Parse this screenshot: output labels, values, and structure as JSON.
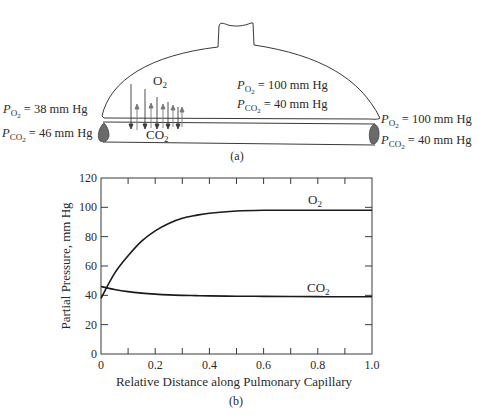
{
  "diagram_a": {
    "caption": "(a)",
    "alveolus_gas_label": "O",
    "alveolus_gas_sub": "2",
    "capillary_gas_label": "CO",
    "capillary_gas_sub": "2",
    "alveolus": {
      "po2": {
        "sym": "P",
        "sub": "O",
        "subsub": "2",
        "value": " = 100 mm Hg"
      },
      "pco2": {
        "sym": "P",
        "sub": "CO",
        "subsub": "2",
        "value": " = 40 mm Hg"
      }
    },
    "venous_end": {
      "po2": {
        "sym": "P",
        "sub": "O",
        "subsub": "2",
        "value": " = 38 mm Hg"
      },
      "pco2": {
        "sym": "P",
        "sub": "CO",
        "subsub": "2",
        "value": " = 46 mm Hg"
      }
    },
    "arterial_end": {
      "po2": {
        "sym": "P",
        "sub": "O",
        "subsub": "2",
        "value": " = 100 mm Hg"
      },
      "pco2": {
        "sym": "P",
        "sub": "CO",
        "subsub": "2",
        "value": " = 40 mm Hg"
      }
    }
  },
  "chart_data": {
    "type": "line",
    "title": "",
    "caption": "(b)",
    "xlabel": "Relative Distance along Pulmonary Capillary",
    "ylabel": "Partial Pressure, mm Hg",
    "xlim": [
      0,
      1.0
    ],
    "ylim": [
      0,
      120
    ],
    "x_ticks": [
      "0",
      "0.2",
      "0.4",
      "0.6",
      "0.8",
      "1.0"
    ],
    "y_ticks": [
      "0",
      "20",
      "40",
      "60",
      "80",
      "100",
      "120"
    ],
    "grid": false,
    "legend": "inline labels",
    "x": [
      0,
      0.05,
      0.1,
      0.15,
      0.2,
      0.25,
      0.3,
      0.35,
      0.4,
      0.5,
      0.6,
      0.7,
      0.8,
      0.9,
      1.0
    ],
    "series": [
      {
        "name": "O2",
        "label": "O",
        "label_sub": "2",
        "values": [
          38,
          55,
          67,
          77,
          84,
          89,
          92.5,
          94.5,
          96,
          97.5,
          98,
          98,
          98,
          98,
          98
        ]
      },
      {
        "name": "CO2",
        "label": "CO",
        "label_sub": "2",
        "values": [
          46,
          44,
          42.5,
          41.5,
          40.8,
          40.3,
          40,
          39.8,
          39.6,
          39.4,
          39.3,
          39.2,
          39.1,
          39,
          39
        ]
      }
    ]
  }
}
